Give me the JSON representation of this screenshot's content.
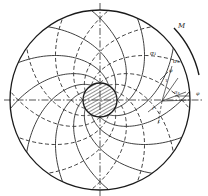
{
  "diagram": {
    "colors": {
      "line": "#2a2a2a",
      "background": "#ffffff",
      "hatch": "#333333"
    },
    "labels": {
      "moment": "M",
      "sigma1_a": "σ₁",
      "sigma1_b": "σ₁",
      "sigma3": "σ₃",
      "tau": "τ",
      "phi_a": "φ",
      "phi_b": "φ",
      "t": "t",
      "r": "r"
    }
  }
}
